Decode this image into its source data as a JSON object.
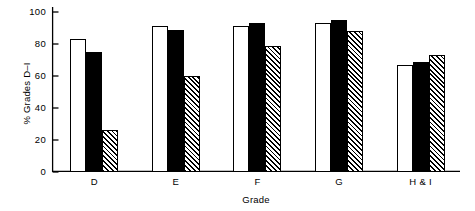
{
  "chart_data": {
    "type": "bar",
    "title": "",
    "subtitle": "",
    "xlabel": "Grade",
    "ylabel": "% Grades D–I",
    "categories": [
      "D",
      "E",
      "F",
      "G",
      "H & I"
    ],
    "series": [
      {
        "name": "series-1",
        "style": "open",
        "fill": "#ffffff",
        "values": [
          83,
          91,
          91,
          93,
          67
        ]
      },
      {
        "name": "series-2",
        "style": "solid",
        "fill": "#000000",
        "values": [
          75,
          89,
          93,
          95,
          69
        ]
      },
      {
        "name": "series-3",
        "style": "hatch",
        "fill": "#ffffff",
        "values": [
          26,
          60,
          79,
          88,
          73
        ]
      }
    ],
    "ylim": [
      0,
      100
    ],
    "yticks": [
      0,
      20,
      40,
      60,
      80,
      100
    ],
    "ytick_labels": [
      "0",
      "20",
      "40",
      "60",
      "80",
      "100"
    ],
    "grid": false,
    "legend": false,
    "legend_position": "none",
    "axis_color": "#000000",
    "background": "#ffffff"
  }
}
